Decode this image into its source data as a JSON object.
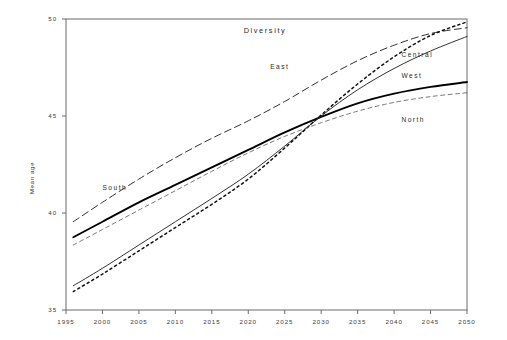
{
  "chart_data": {
    "type": "line",
    "title": "Diversity",
    "xlabel": "",
    "ylabel": "Mean age",
    "xlim": [
      1995,
      2050
    ],
    "ylim": [
      35,
      50
    ],
    "grid": false,
    "legend_position": "inline-right",
    "xticks": [
      1995,
      2000,
      2005,
      2010,
      2015,
      2020,
      2025,
      2030,
      2035,
      2040,
      2045,
      2050
    ],
    "yticks": [
      35,
      40,
      45,
      50
    ],
    "x": [
      1996,
      2000,
      2005,
      2010,
      2015,
      2020,
      2025,
      2030,
      2035,
      2040,
      2045,
      2050
    ],
    "series": [
      {
        "name": "South",
        "style": "dashed",
        "width": 0.9,
        "color": "#1a1a1a",
        "label_x": 2000,
        "label_y": 41.2,
        "values": [
          39.55,
          40.55,
          41.75,
          42.85,
          43.85,
          44.75,
          45.75,
          46.85,
          47.85,
          48.65,
          49.25,
          49.55
        ]
      },
      {
        "name": "West",
        "style": "solid-bold",
        "width": 1.9,
        "color": "#000000",
        "label_x": 2041,
        "label_y": 46.95,
        "values": [
          38.75,
          39.55,
          40.55,
          41.45,
          42.35,
          43.25,
          44.15,
          44.95,
          45.65,
          46.15,
          46.5,
          46.75
        ]
      },
      {
        "name": "East",
        "style": "dotted",
        "width": 1.5,
        "color": "#111111",
        "label_x": 2023,
        "label_y": 47.4,
        "values": [
          35.95,
          36.85,
          38.05,
          39.25,
          40.45,
          41.75,
          43.35,
          45.05,
          46.65,
          48.05,
          49.15,
          49.85
        ]
      },
      {
        "name": "Central",
        "style": "solid",
        "width": 0.9,
        "color": "#1a1a1a",
        "label_x": 2041,
        "label_y": 48.05,
        "values": [
          36.25,
          37.15,
          38.35,
          39.55,
          40.75,
          42.0,
          43.45,
          45.0,
          46.35,
          47.45,
          48.35,
          49.1
        ]
      },
      {
        "name": "North",
        "style": "dashed-fine",
        "width": 0.8,
        "color": "#555555",
        "label_x": 2041,
        "label_y": 44.7,
        "values": [
          38.35,
          39.15,
          40.15,
          41.15,
          42.15,
          43.1,
          43.95,
          44.65,
          45.25,
          45.7,
          46.0,
          46.2
        ]
      }
    ]
  },
  "axis": {
    "y_title": "Mean age"
  }
}
